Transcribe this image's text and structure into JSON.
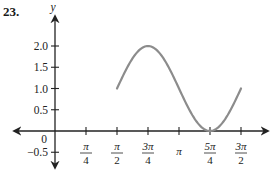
{
  "problem": {
    "number": "23."
  },
  "chart_data": {
    "type": "line",
    "title": "",
    "xlabel": "",
    "ylabel": "y",
    "function": "y = 1 - sin(2x)",
    "x_domain": [
      "π/2",
      "3π/2"
    ],
    "x_ticks": [
      {
        "label_num": "π",
        "label_den": "4",
        "value": 0.7854
      },
      {
        "label_num": "π",
        "label_den": "2",
        "value": 1.5708
      },
      {
        "label_num": "3π",
        "label_den": "4",
        "value": 2.3562
      },
      {
        "label_num": "π",
        "label_den": "",
        "value": 3.1416
      },
      {
        "label_num": "5π",
        "label_den": "4",
        "value": 3.927
      },
      {
        "label_num": "3π",
        "label_den": "2",
        "value": 4.7124
      }
    ],
    "y_ticks": [
      {
        "label": "2.0",
        "value": 2.0
      },
      {
        "label": "1.5",
        "value": 1.5
      },
      {
        "label": "1.0",
        "value": 1.0
      },
      {
        "label": "0.5",
        "value": 0.5
      },
      {
        "label": "0",
        "value": 0
      },
      {
        "label": "−0.5",
        "value": -0.5
      }
    ],
    "x": [
      1.5708,
      1.9635,
      2.3562,
      2.7489,
      3.1416,
      3.5343,
      3.927,
      4.3197,
      4.7124
    ],
    "values": [
      1.0,
      1.707,
      2.0,
      1.707,
      1.0,
      0.293,
      0.0,
      0.293,
      1.0
    ],
    "key_points": [
      {
        "x": "π/2",
        "y": 1
      },
      {
        "x": "3π/4",
        "y": 2
      },
      {
        "x": "π",
        "y": 1
      },
      {
        "x": "5π/4",
        "y": 0
      },
      {
        "x": "3π/2",
        "y": 1
      }
    ],
    "ylim": [
      -0.5,
      2.0
    ],
    "grid": false,
    "legend": false,
    "curve_color": "#8c8c8c",
    "axis_color": "#222222"
  }
}
